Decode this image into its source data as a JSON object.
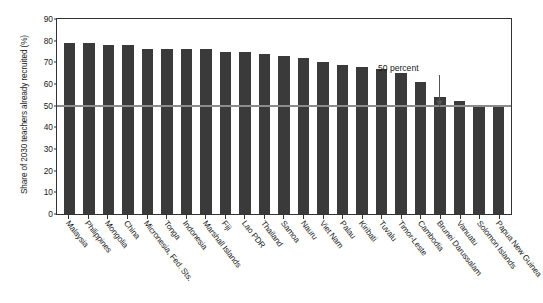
{
  "chart_data": {
    "type": "bar",
    "title": "",
    "xlabel": "",
    "ylabel": "Share of 2030 teachers already recruited (%)",
    "ylim": [
      0,
      90
    ],
    "yticks": [
      0,
      10,
      20,
      30,
      40,
      50,
      60,
      70,
      80,
      90
    ],
    "grid": false,
    "legend": null,
    "bar_color": "#3a3a3a",
    "reference_line": {
      "value": 50,
      "label": "50 percent",
      "color": "#8c8c8c"
    },
    "annotations": [
      {
        "text": "50 percent",
        "points_to_category": "Brunei Darussalam",
        "points_to_value": 50
      }
    ],
    "categories": [
      "Malaysia",
      "Philippines",
      "Mongolia",
      "China",
      "Micronesia, Fed. Sts.",
      "Tonga",
      "Indonesia",
      "Marshall Islands",
      "Fiji",
      "Lao PDR",
      "Thailand",
      "Samoa",
      "Nauru",
      "Viet Nam",
      "Palau",
      "Kiribati",
      "Tuvalu",
      "Timor-Leste",
      "Cambodia",
      "Brunei Darussalam",
      "Vanuatu",
      "Solomon Islands",
      "Papua New Guinea"
    ],
    "values": [
      79,
      79,
      78,
      78,
      76,
      76,
      76,
      76,
      75,
      75,
      74,
      73,
      72,
      70,
      69,
      68,
      67,
      65,
      61,
      54,
      52,
      50,
      50
    ]
  }
}
